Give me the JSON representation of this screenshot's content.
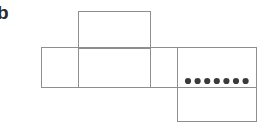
{
  "figure": {
    "panel_label": "b",
    "colors": {
      "background": "#ffffff",
      "edge_stroke": "#8e8e8e",
      "face_fill": "#ffffff",
      "pip_fill": "#3a3a3a",
      "label_color": "#2b2b2b"
    },
    "geometry": {
      "width": 260,
      "height": 134,
      "stroke_width": 1
    },
    "faces": [
      {
        "id": "face-top",
        "name": "top-square",
        "x": 78,
        "y": 11,
        "width": 72,
        "height": 37,
        "pips": 0
      },
      {
        "id": "face-row-1",
        "name": "strip-cell-1",
        "x": 41,
        "y": 47,
        "width": 37,
        "height": 40,
        "pips": 0
      },
      {
        "id": "face-row-2",
        "name": "strip-cell-2",
        "x": 78,
        "y": 47,
        "width": 72,
        "height": 40,
        "pips": 0
      },
      {
        "id": "face-row-3",
        "name": "strip-cell-3",
        "x": 150,
        "y": 47,
        "width": 27,
        "height": 40,
        "pips": 0
      },
      {
        "id": "face-row-4",
        "name": "strip-cell-4-dotted",
        "x": 177,
        "y": 47,
        "width": 79,
        "height": 40,
        "pips": 7
      },
      {
        "id": "face-bottom",
        "name": "bottom-square",
        "x": 177,
        "y": 87,
        "width": 79,
        "height": 34,
        "pips": 0
      }
    ],
    "pip_row": {
      "count": 7,
      "radius": 3.1,
      "center_y": 81,
      "start_x": 188,
      "spacing": 9.6
    }
  }
}
